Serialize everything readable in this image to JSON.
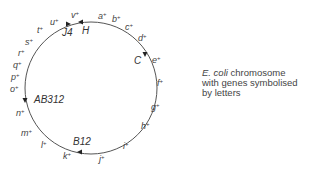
{
  "chromosome": {
    "center": [
      91,
      88
    ],
    "radius": 66,
    "stroke_color": "#555555",
    "genes": [
      {
        "label": "a",
        "sup": "+",
        "x": 98,
        "y": 19
      },
      {
        "label": "b",
        "sup": "+",
        "x": 112,
        "y": 22
      },
      {
        "label": "c",
        "sup": "+",
        "x": 125,
        "y": 30
      },
      {
        "label": "d",
        "sup": "+",
        "x": 138,
        "y": 41
      },
      {
        "label": "e",
        "sup": "+",
        "x": 152,
        "y": 63
      },
      {
        "label": "f",
        "sup": "+",
        "x": 157,
        "y": 86
      },
      {
        "label": "g",
        "sup": "+",
        "x": 151,
        "y": 110
      },
      {
        "label": "h",
        "sup": "+",
        "x": 141,
        "y": 129
      },
      {
        "label": "i",
        "sup": "+",
        "x": 123,
        "y": 149
      },
      {
        "label": "j",
        "sup": "+",
        "x": 99,
        "y": 162
      },
      {
        "label": "k",
        "sup": "+",
        "x": 63,
        "y": 159
      },
      {
        "label": "l",
        "sup": "+",
        "x": 41,
        "y": 148
      },
      {
        "label": "m",
        "sup": "+",
        "x": 21,
        "y": 136
      },
      {
        "label": "n",
        "sup": "+",
        "x": 16,
        "y": 116
      },
      {
        "label": "o",
        "sup": "+",
        "x": 10,
        "y": 92
      },
      {
        "label": "p",
        "sup": "+",
        "x": 11,
        "y": 80
      },
      {
        "label": "q",
        "sup": "+",
        "x": 13,
        "y": 68
      },
      {
        "label": "r",
        "sup": "+",
        "x": 18,
        "y": 56
      },
      {
        "label": "s",
        "sup": "+",
        "x": 25,
        "y": 45
      },
      {
        "label": "t",
        "sup": "+",
        "x": 37,
        "y": 33
      },
      {
        "label": "u",
        "sup": "+",
        "x": 50,
        "y": 25
      },
      {
        "label": "v",
        "sup": "+",
        "x": 71,
        "y": 18
      }
    ],
    "markers": [
      {
        "label": "J4",
        "x": 62,
        "y": 36,
        "arrow_x": 68,
        "arrow_y": 24,
        "arrow_dir": "right"
      },
      {
        "label": "H",
        "x": 82,
        "y": 34,
        "arrow_x": 81,
        "arrow_y": 22,
        "arrow_dir": "left"
      },
      {
        "label": "C",
        "x": 134,
        "y": 64,
        "arrow_x": 145,
        "arrow_y": 54,
        "arrow_dir": "down"
      },
      {
        "label": "AB312",
        "x": 34,
        "y": 103,
        "arrow_x": 25,
        "arrow_y": 100,
        "arrow_dir": "down"
      },
      {
        "label": "B12",
        "x": 73,
        "y": 145,
        "arrow_x": 80,
        "arrow_y": 152,
        "arrow_dir": "left"
      }
    ]
  },
  "caption": {
    "species": "E. coli",
    "line1_rest": " chromosome",
    "line2": "with genes symbolised",
    "line3": "by letters"
  }
}
